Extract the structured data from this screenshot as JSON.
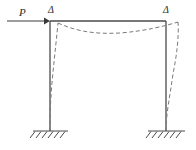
{
  "figure": {
    "background_color": "#ffffff",
    "line_color": "#3a3a3a",
    "dashed_color": "#707070",
    "labels": {
      "load": "P",
      "delta_left": "Δ",
      "delta_right": "Δ"
    },
    "elements": {
      "load_arrow": "load-arrow",
      "left_column": "left-column",
      "right_column": "right-column",
      "beam": "top-beam",
      "deflected_shape": "deflected-shape-dashed",
      "left_support": "fixed-support-left",
      "right_support": "fixed-support-right"
    },
    "geometry": {
      "beam_y": 21,
      "left_column_x": 50,
      "right_column_x": 166,
      "base_y": 131,
      "arrow_start_x": 7,
      "arrow_end_x": 49,
      "arrow_y": 21
    }
  }
}
